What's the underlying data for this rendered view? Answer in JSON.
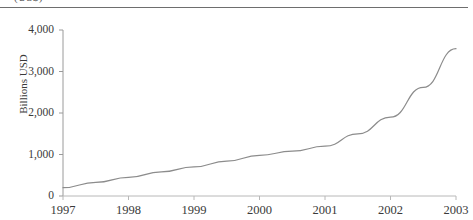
{
  "figure": {
    "caption_fragment": "(US$)",
    "ylabel": "Billions USD"
  },
  "chart_data": {
    "type": "line",
    "title": "",
    "subtitle": "",
    "xlabel": "",
    "ylabel": "Billions USD",
    "x": [
      1997,
      1998,
      1999,
      2000,
      2001,
      2002,
      2003
    ],
    "xtick_labels": [
      "1997",
      "1998",
      "1999",
      "2000",
      "2001",
      "2002",
      "2003"
    ],
    "ytick_labels": [
      "0",
      "1,000",
      "2,000",
      "3,000",
      "4,000"
    ],
    "ytick_values": [
      0,
      1000,
      2000,
      3000,
      4000
    ],
    "xlim": [
      1997,
      2003
    ],
    "ylim": [
      0,
      4000
    ],
    "grid": false,
    "legend": "none",
    "series": [
      {
        "name": "Billions USD",
        "color": "#8c8c8c",
        "values": [
          200,
          450,
          700,
          980,
          1200,
          1900,
          3550
        ]
      }
    ],
    "dense_x": [
      1997,
      1997.5,
      1998,
      1998.5,
      1999,
      1999.5,
      2000,
      2000.5,
      2001,
      2001.5,
      2002,
      2002.5,
      2003
    ],
    "dense_values": [
      200,
      330,
      450,
      580,
      700,
      840,
      980,
      1080,
      1200,
      1500,
      1900,
      2620,
      3550
    ]
  }
}
